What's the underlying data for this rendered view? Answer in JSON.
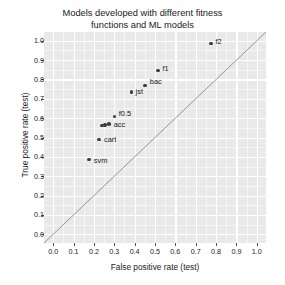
{
  "chart_data": {
    "type": "scatter",
    "title": "Models developed with different fitness\nfunctions and ML models",
    "xlabel": "False positive rate (test)",
    "ylabel": "True positive rate (test)",
    "xlim": [
      0.0,
      1.0
    ],
    "ylim": [
      0.0,
      1.0
    ],
    "grid": true,
    "legend": "none",
    "xticks": [
      "0.0",
      "0.1",
      "0.2",
      "0.3",
      "0.4",
      "0.5",
      "0.6",
      "0.7",
      "0.8",
      "0.9",
      "1.0"
    ],
    "xtick_values": [
      0.0,
      0.1,
      0.2,
      0.3,
      0.4,
      0.5,
      0.6,
      0.7,
      0.8,
      0.9,
      1.0
    ],
    "yticks": [
      "0.0",
      "0.1",
      "0.2",
      "0.3",
      "0.4",
      "0.5",
      "0.6",
      "0.7",
      "0.8",
      "0.9",
      "1.0"
    ],
    "ytick_values": [
      0.0,
      0.1,
      0.2,
      0.3,
      0.4,
      0.5,
      0.6,
      0.7,
      0.8,
      0.9,
      1.0
    ],
    "annotations": [
      {
        "label": "f2",
        "x": 0.775,
        "y": 0.985,
        "label_dx": 4.5,
        "label_dy": -5.5
      },
      {
        "label": "f1",
        "x": 0.515,
        "y": 0.845,
        "label_dx": 4.5,
        "label_dy": -5.5
      },
      {
        "label": "bac",
        "x": 0.45,
        "y": 0.77,
        "label_dx": 5.0,
        "label_dy": -7.5
      },
      {
        "label": "jst",
        "x": 0.385,
        "y": 0.735,
        "label_dx": 4.0,
        "label_dy": -4.0
      },
      {
        "label": "f0.5",
        "x": 0.3,
        "y": 0.61,
        "label_dx": 4.5,
        "label_dy": -6.5
      },
      {
        "label": "acc",
        "x": 0.275,
        "y": 0.57,
        "label_dx": 4.5,
        "label_dy": -3.0
      },
      {
        "label": "",
        "x": 0.255,
        "y": 0.565,
        "label_dx": 0,
        "label_dy": 0
      },
      {
        "label": "",
        "x": 0.24,
        "y": 0.562,
        "label_dx": 0,
        "label_dy": 0
      },
      {
        "label": "cart",
        "x": 0.225,
        "y": 0.49,
        "label_dx": 5.0,
        "label_dy": -3.0
      },
      {
        "label": "svm",
        "x": 0.175,
        "y": 0.385,
        "label_dx": 5.0,
        "label_dy": -3.0
      }
    ],
    "reference_line": {
      "type": "diagonal",
      "from": [
        0.0,
        0.0
      ],
      "to": [
        1.0,
        1.0
      ],
      "color": "#8c8c8c"
    },
    "point_color": "#3d3d3d",
    "panel_color": "#e9e9e9",
    "grid_color": "#ffffff"
  }
}
